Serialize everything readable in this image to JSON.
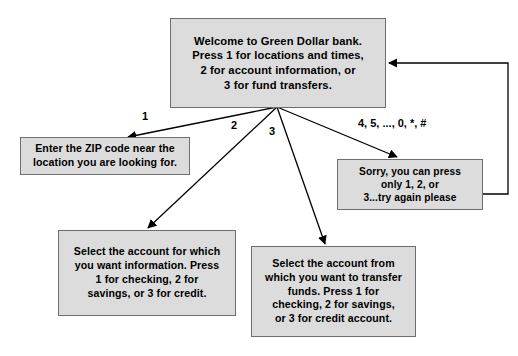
{
  "diagram": {
    "background_color": "#ffffff",
    "node_fill_color": "#dcdcdc",
    "node_border_color": "#6e6e6e",
    "edge_color": "#000000"
  },
  "nodes": {
    "welcome": {
      "text": "Welcome to Green Dollar bank.\nPress 1 for locations and times,\n2 for account information, or\n3 for fund transfers."
    },
    "zip": {
      "text": "Enter the ZIP code near the\nlocation you are looking for."
    },
    "sorry": {
      "text": "Sorry, you can press\nonly 1, 2, or\n3...try again please"
    },
    "account_info": {
      "text": "Select the account for which\nyou want information. Press\n1 for checking, 2 for\nsavings, or 3 for credit."
    },
    "transfer": {
      "text": "Select the account from\nwhich you want to transfer\nfunds. Press 1 for\nchecking, 2 for savings,\nor 3 for credit account."
    }
  },
  "edge_labels": {
    "one": "1",
    "two": "2",
    "three": "3",
    "other": "4, 5, ..., 0, *, #"
  },
  "edges": [
    {
      "name": "welcome-to-zip",
      "label": "1"
    },
    {
      "name": "welcome-to-account-info",
      "label": "2"
    },
    {
      "name": "welcome-to-transfer",
      "label": "3"
    },
    {
      "name": "welcome-to-sorry",
      "label": "4, 5, ..., 0, *, #"
    },
    {
      "name": "sorry-to-welcome",
      "label": ""
    }
  ]
}
